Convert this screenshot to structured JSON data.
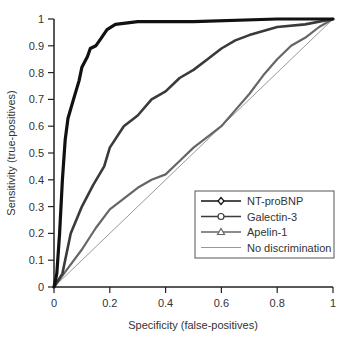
{
  "chart_data": {
    "type": "line",
    "title": "",
    "xlabel": "Specificity (false-positives)",
    "ylabel": "Sensitivity (true-positives)",
    "xlim": [
      0,
      1
    ],
    "ylim": [
      0,
      1
    ],
    "grid": false,
    "legend_position": "lower right",
    "x_ticks": [
      "0",
      "0.2",
      "0.4",
      "0.6",
      "0.8",
      "1"
    ],
    "y_ticks": [
      "0",
      "0.1",
      "0.2",
      "0.3",
      "0.4",
      "0.5",
      "0.6",
      "0.7",
      "0.8",
      "0.9",
      "1"
    ],
    "series": [
      {
        "name": "NT-proBNP",
        "marker": "diamond",
        "color": "#111111",
        "width": 3.2,
        "x": [
          0,
          0.01,
          0.02,
          0.03,
          0.04,
          0.05,
          0.07,
          0.09,
          0.1,
          0.12,
          0.13,
          0.15,
          0.17,
          0.19,
          0.22,
          0.3,
          0.5,
          0.8,
          1
        ],
        "y": [
          0,
          0.05,
          0.2,
          0.4,
          0.55,
          0.63,
          0.7,
          0.77,
          0.82,
          0.86,
          0.89,
          0.9,
          0.93,
          0.96,
          0.98,
          0.99,
          0.99,
          1.0,
          1.0
        ]
      },
      {
        "name": "Galectin-3",
        "marker": "circle",
        "color": "#3a3a3a",
        "width": 2.6,
        "x": [
          0,
          0.03,
          0.06,
          0.1,
          0.14,
          0.18,
          0.2,
          0.25,
          0.3,
          0.35,
          0.4,
          0.45,
          0.5,
          0.55,
          0.6,
          0.65,
          0.7,
          0.8,
          0.9,
          1
        ],
        "y": [
          0,
          0.05,
          0.2,
          0.3,
          0.38,
          0.45,
          0.52,
          0.6,
          0.64,
          0.7,
          0.73,
          0.78,
          0.81,
          0.85,
          0.89,
          0.92,
          0.94,
          0.97,
          0.98,
          1.0
        ]
      },
      {
        "name": "Apelin-1",
        "marker": "triangle",
        "color": "#666666",
        "width": 2.2,
        "x": [
          0,
          0.05,
          0.1,
          0.15,
          0.2,
          0.25,
          0.3,
          0.35,
          0.4,
          0.45,
          0.5,
          0.55,
          0.6,
          0.65,
          0.7,
          0.75,
          0.8,
          0.85,
          0.9,
          0.95,
          1
        ],
        "y": [
          0,
          0.07,
          0.14,
          0.22,
          0.29,
          0.33,
          0.37,
          0.4,
          0.42,
          0.47,
          0.52,
          0.56,
          0.6,
          0.66,
          0.72,
          0.79,
          0.85,
          0.9,
          0.93,
          0.97,
          1.0
        ]
      },
      {
        "name": "No discrimination",
        "marker": "none",
        "color": "#999999",
        "width": 1,
        "x": [
          0,
          1
        ],
        "y": [
          0,
          1
        ]
      }
    ]
  }
}
